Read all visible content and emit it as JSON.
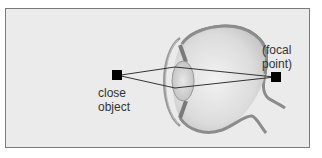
{
  "diagram": {
    "type": "eye-accommodation",
    "labels": {
      "object_line1": "close",
      "object_line2": "object",
      "focal_line1": "(focal",
      "focal_line2": "point)"
    },
    "colors": {
      "background": "#ebebeb",
      "border": "#7a7a7a",
      "eye_wall": "#8c8c8c",
      "eye_fill": "#d6d6d6",
      "ray": "#333333",
      "marker": "#000000"
    }
  }
}
